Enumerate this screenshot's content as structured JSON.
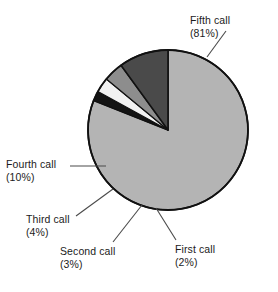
{
  "chart_data": {
    "type": "pie",
    "title": "",
    "subtitle": "",
    "xlabel": "",
    "ylabel": "",
    "legend_position": "none",
    "grid": false,
    "labels_show_percent": true,
    "categories": [
      "First call",
      "Second call",
      "Third call",
      "Fourth call",
      "Fifth call"
    ],
    "values": [
      2,
      3,
      4,
      10,
      81
    ],
    "unit": "%",
    "slices": [
      {
        "name": "First call",
        "value": 2,
        "percent_text": "(2%)",
        "color": "#141414"
      },
      {
        "name": "Second call",
        "value": 3,
        "percent_text": "(3%)",
        "color": "#f2f2f2"
      },
      {
        "name": "Third call",
        "value": 4,
        "percent_text": "(4%)",
        "color": "#8d8d8d"
      },
      {
        "name": "Fourth call",
        "value": 10,
        "percent_text": "(10%)",
        "color": "#4a4a4a"
      },
      {
        "name": "Fifth call",
        "value": 81,
        "percent_text": "(81%)",
        "color": "#b4b4b4"
      }
    ]
  },
  "labels": {
    "fifth": {
      "name": "Fifth call",
      "percent": "(81%)"
    },
    "fourth": {
      "name": "Fourth call",
      "percent": "(10%)"
    },
    "third": {
      "name": "Third call",
      "percent": "(4%)"
    },
    "second": {
      "name": "Second call",
      "percent": "(3%)"
    },
    "first": {
      "name": "First call",
      "percent": "(2%)"
    }
  },
  "style": {
    "outline_color": "#111111",
    "leader_color": "#4a4a4a",
    "background": "#ffffff",
    "text_color": "#1b1b1b"
  }
}
